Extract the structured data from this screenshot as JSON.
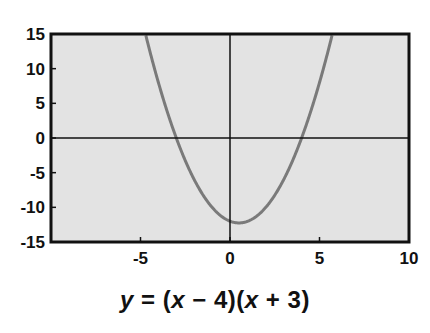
{
  "chart_data": {
    "type": "line",
    "title": "",
    "caption": "y = (x − 4)(x + 3)",
    "function": "(x - 4)*(x + 3)",
    "xlabel": "",
    "ylabel": "",
    "xlim": [
      -10,
      10
    ],
    "ylim": [
      -15,
      15
    ],
    "x_ticks": [
      -5,
      0,
      5,
      10
    ],
    "x_tick_labels": [
      "-5",
      "0",
      "5",
      "10"
    ],
    "y_ticks": [
      15,
      10,
      5,
      0,
      -5,
      -10,
      -15
    ],
    "y_tick_labels": [
      "15",
      "10",
      "5",
      "0",
      "-5",
      "-10",
      "-15"
    ],
    "grid": false,
    "legend": null,
    "series": [
      {
        "name": "y = (x − 4)(x + 3)",
        "x": [
          -4.72,
          -4,
          -3,
          -2,
          -1,
          0,
          0.5,
          1,
          2,
          3,
          4,
          5,
          5.72
        ],
        "y": [
          15,
          13,
          0,
          -6,
          -10,
          -12,
          -12.25,
          -12,
          -10,
          -6,
          0,
          8,
          15
        ]
      }
    ],
    "key_points": {
      "roots": [
        -3,
        4
      ],
      "y_intercept": -12,
      "vertex": [
        0.5,
        -12.25
      ]
    },
    "colors": {
      "plot_background": "#e3e3e3",
      "curve": "#7a7a7a",
      "axes": "#111111"
    }
  },
  "equation": {
    "y": "y",
    "eq": " = (",
    "x1": "x",
    "mid1": " − 4)(",
    "x2": "x",
    "mid2": " + 3)"
  }
}
